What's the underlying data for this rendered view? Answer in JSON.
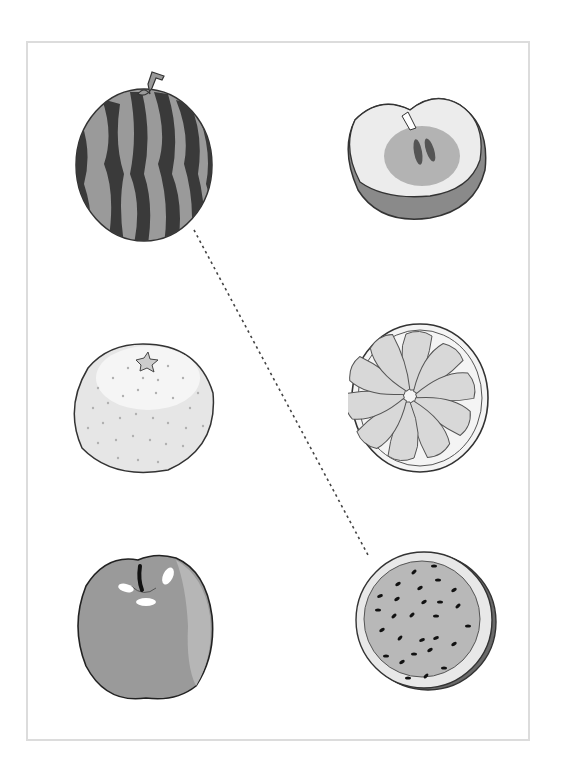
{
  "worksheet": {
    "type": "matching-exercise",
    "frame_color": "#dcdcdc",
    "line_style": "dotted",
    "left_column": [
      {
        "id": "watermelon-whole",
        "label": "Whole watermelon"
      },
      {
        "id": "orange-whole",
        "label": "Whole orange"
      },
      {
        "id": "apple-whole",
        "label": "Whole apple"
      }
    ],
    "right_column": [
      {
        "id": "apple-half",
        "label": "Apple cut in half"
      },
      {
        "id": "orange-half",
        "label": "Orange cut in half"
      },
      {
        "id": "watermelon-half",
        "label": "Watermelon cut in half"
      }
    ],
    "connections": [
      {
        "from": "watermelon-whole",
        "to": "watermelon-half",
        "x1": 194,
        "y1": 230,
        "x2": 368,
        "y2": 555
      }
    ]
  }
}
